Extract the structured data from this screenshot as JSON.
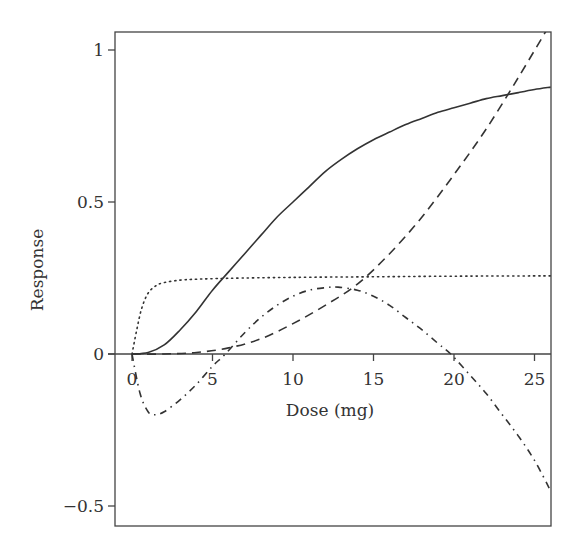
{
  "chart_data": {
    "type": "line",
    "title": "",
    "xlabel": "Dose (mg)",
    "ylabel": "Response",
    "xlim": [
      -1,
      26
    ],
    "ylim": [
      -0.57,
      1.07
    ],
    "xticks": [
      0,
      5,
      10,
      15,
      20,
      25
    ],
    "xtick_labels": [
      "0",
      "5",
      "10",
      "15",
      "20",
      "25"
    ],
    "yticks": [
      1,
      0.5,
      0,
      -0.5
    ],
    "ytick_labels": [
      "1",
      "0.5",
      "0",
      "−0.5"
    ],
    "grid": false,
    "legend": null,
    "series": [
      {
        "name": "solid",
        "style": "solid",
        "x": [
          0,
          1,
          2,
          3,
          4,
          5,
          6,
          7,
          8,
          9,
          10,
          11,
          12,
          13,
          14,
          15,
          16,
          17,
          18,
          19,
          20,
          21,
          22,
          23,
          24,
          25,
          26
        ],
        "y": [
          0.0,
          0.005,
          0.03,
          0.08,
          0.14,
          0.21,
          0.27,
          0.33,
          0.39,
          0.45,
          0.5,
          0.55,
          0.6,
          0.64,
          0.675,
          0.705,
          0.73,
          0.755,
          0.775,
          0.795,
          0.81,
          0.825,
          0.84,
          0.85,
          0.86,
          0.87,
          0.878
        ]
      },
      {
        "name": "dotted",
        "style": "dotted",
        "x": [
          0,
          0.3,
          0.6,
          1,
          1.5,
          2,
          3,
          4,
          6,
          10,
          15,
          20,
          26
        ],
        "y": [
          0.0,
          0.08,
          0.15,
          0.2,
          0.225,
          0.235,
          0.243,
          0.246,
          0.249,
          0.252,
          0.254,
          0.256,
          0.257
        ]
      },
      {
        "name": "dashed",
        "style": "dashed",
        "x": [
          0,
          2,
          4,
          6,
          8,
          10,
          12,
          14,
          16,
          18,
          20,
          22,
          24,
          25.8
        ],
        "y": [
          0.0,
          0.0,
          0.005,
          0.02,
          0.05,
          0.1,
          0.16,
          0.23,
          0.33,
          0.45,
          0.59,
          0.74,
          0.91,
          1.07
        ]
      },
      {
        "name": "dash-dot",
        "style": "dashdot",
        "x": [
          0,
          0.5,
          1,
          1.4,
          2,
          3,
          4,
          5,
          5.8,
          7,
          8,
          9,
          10,
          11,
          12,
          12.8,
          14,
          15,
          16,
          17,
          18,
          19,
          19.8,
          21,
          22,
          23,
          24,
          25,
          26
        ],
        "y": [
          0.0,
          -0.13,
          -0.19,
          -0.2,
          -0.19,
          -0.15,
          -0.1,
          -0.04,
          0.0,
          0.07,
          0.12,
          0.16,
          0.19,
          0.21,
          0.218,
          0.22,
          0.21,
          0.19,
          0.16,
          0.12,
          0.08,
          0.035,
          0.0,
          -0.07,
          -0.13,
          -0.2,
          -0.27,
          -0.35,
          -0.45
        ]
      }
    ]
  }
}
